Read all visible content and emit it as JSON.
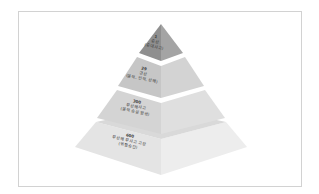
{
  "diagram": {
    "type": "pyramid",
    "title": "",
    "colors": {
      "tier1_left": "#8f8f8f",
      "tier1_right": "#a3a3a3",
      "tier2_left": "#c4c4c4",
      "tier2_right": "#d2d2d2",
      "tier3_left": "#d3d3d3",
      "tier3_right": "#dedede",
      "tier4_left": "#e3e3e3",
      "tier4_right": "#ececec",
      "frame_border": "#d2d2d2"
    },
    "tiers": [
      {
        "number": "1",
        "lines": [
          "중상",
          "(중대사고)"
        ]
      },
      {
        "number": "29",
        "lines": [
          "경상",
          "(물적, 인적, 상해)"
        ]
      },
      {
        "number": "300",
        "lines": [
          "무상해사고",
          "(물적 손실 발생)"
        ]
      },
      {
        "number": "600",
        "lines": [
          "무상해 무사고 고장",
          "(위험순간)"
        ]
      }
    ]
  }
}
